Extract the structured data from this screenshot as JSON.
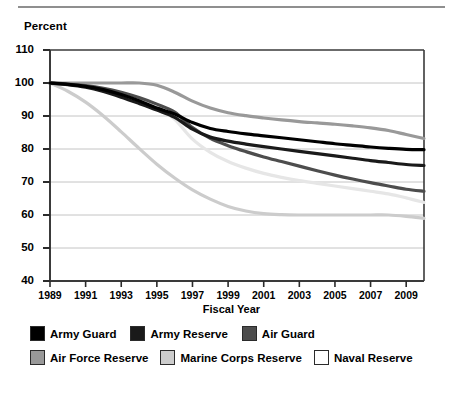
{
  "chart_data": {
    "type": "line",
    "title": "",
    "ylabel": "Percent",
    "xlabel": "Fiscal Year",
    "ylim": [
      40,
      110
    ],
    "xlim": [
      1989,
      2010
    ],
    "grid": true,
    "legend_position": "bottom",
    "ytick_labels": [
      "110",
      "100",
      "90",
      "80",
      "70",
      "60",
      "50",
      "40"
    ],
    "ytick_values": [
      110,
      100,
      90,
      80,
      70,
      60,
      50,
      40
    ],
    "xtick_labels": [
      "1989",
      "1991",
      "1993",
      "1995",
      "1997",
      "1999",
      "2001",
      "2003",
      "2005",
      "2007",
      "2009"
    ],
    "xtick_values": [
      1989,
      1991,
      1993,
      1995,
      1997,
      1999,
      2001,
      2003,
      2005,
      2007,
      2009
    ],
    "x": [
      1989,
      1990,
      1991,
      1992,
      1993,
      1994,
      1995,
      1996,
      1997,
      1998,
      1999,
      2000,
      2001,
      2002,
      2003,
      2004,
      2005,
      2006,
      2007,
      2008,
      2009,
      2010
    ],
    "series": [
      {
        "name": "Army Guard",
        "color": "#000000",
        "values": [
          100,
          99.6,
          99.0,
          98.0,
          96.5,
          94.6,
          92.4,
          90.6,
          88.0,
          86.2,
          85.3,
          84.6,
          84.0,
          83.4,
          82.8,
          82.2,
          81.6,
          81.1,
          80.6,
          80.2,
          79.9,
          79.8
        ]
      },
      {
        "name": "Army Reserve",
        "color": "#1a1a1a",
        "values": [
          100,
          99.5,
          98.7,
          97.4,
          95.7,
          93.8,
          91.8,
          89.6,
          86.0,
          83.6,
          82.4,
          81.5,
          80.7,
          80.0,
          79.3,
          78.6,
          77.9,
          77.2,
          76.5,
          75.9,
          75.3,
          75.0
        ]
      },
      {
        "name": "Air Guard",
        "color": "#4d4d4d",
        "values": [
          100,
          99.7,
          99.2,
          98.4,
          97.2,
          95.6,
          93.6,
          91.2,
          86.5,
          83.2,
          81.0,
          79.2,
          77.6,
          76.2,
          74.8,
          73.4,
          72.1,
          70.9,
          69.8,
          68.8,
          67.8,
          67.2
        ]
      },
      {
        "name": "Air Force Reserve",
        "color": "#999999",
        "values": [
          100,
          100,
          100,
          100,
          100,
          100,
          99.3,
          97.2,
          94.5,
          92.4,
          91.0,
          90.1,
          89.4,
          88.8,
          88.3,
          87.9,
          87.5,
          87.0,
          86.4,
          85.6,
          84.4,
          83.2
        ]
      },
      {
        "name": "Marine Corps Reserve",
        "color": "#cccccc",
        "values": [
          100,
          97.5,
          94.2,
          90.0,
          85.2,
          80.2,
          75.4,
          71.2,
          67.6,
          64.8,
          62.6,
          61.2,
          60.4,
          60.1,
          60.0,
          60.0,
          60.0,
          60.0,
          60.0,
          60.0,
          59.6,
          59.0
        ]
      },
      {
        "name": "Naval Reserve",
        "color": "#e6e6e6",
        "values": [
          100,
          99.6,
          99.0,
          98.2,
          97.0,
          95.4,
          93.0,
          89.0,
          83.0,
          79.0,
          76.2,
          74.2,
          72.6,
          71.4,
          70.4,
          69.6,
          68.8,
          68.0,
          67.2,
          66.4,
          65.2,
          63.8
        ]
      }
    ]
  },
  "legend": {
    "row1": [
      {
        "label": "Army Guard",
        "color": "#000000"
      },
      {
        "label": "Army Reserve",
        "color": "#1a1a1a"
      },
      {
        "label": "Air Guard",
        "color": "#4d4d4d"
      }
    ],
    "row2": [
      {
        "label": "Air Force Reserve",
        "color": "#999999"
      },
      {
        "label": "Marine Corps Reserve",
        "color": "#cccccc"
      },
      {
        "label": "Naval Reserve",
        "color": "#ffffff"
      }
    ]
  }
}
